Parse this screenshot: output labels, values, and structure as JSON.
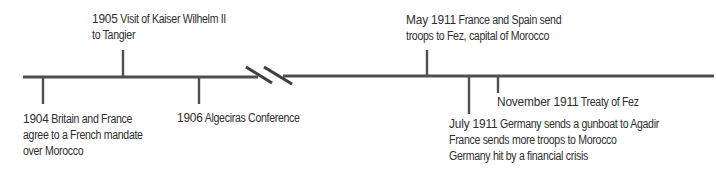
{
  "timeline": {
    "line_color": "#555555",
    "events": [
      {
        "id": "1904",
        "position": "below",
        "year": "1904",
        "text_first_line": "Britain and France",
        "text_more_lines": [
          "agree to a French mandate",
          "over Morocco"
        ]
      },
      {
        "id": "1905",
        "position": "above",
        "year": "1905",
        "text_first_line": "Visit of Kaiser Wilhelm II",
        "text_more_lines": [
          "to Tangier"
        ]
      },
      {
        "id": "1906",
        "position": "below",
        "year": "1906",
        "text_first_line": "Algeciras Conference",
        "text_more_lines": []
      },
      {
        "id": "may-1911",
        "position": "above",
        "year": "May 1911",
        "text_first_line": "France and Spain send",
        "text_more_lines": [
          "troops to Fez, capital of Morocco"
        ]
      },
      {
        "id": "july-1911",
        "position": "below",
        "year": "July 1911",
        "text_first_line": "Germany sends a gunboat to Agadir",
        "text_more_lines": [
          "France sends more troops to Morocco",
          "Germany hit by a financial crisis"
        ]
      },
      {
        "id": "november-1911",
        "position": "below",
        "year": "November 1911",
        "text_first_line": "Treaty of Fez",
        "text_more_lines": []
      }
    ],
    "break_marker": "axis-break"
  }
}
